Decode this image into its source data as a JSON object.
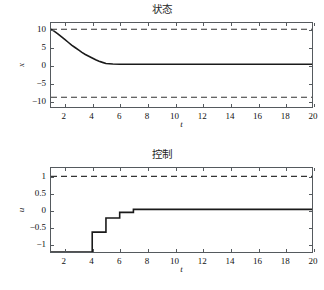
{
  "figure": {
    "background": "#ffffff",
    "line_color": "#1a1a1a",
    "axis_color": "#555a5e",
    "constraint_color": "#333333"
  },
  "chart_data": [
    {
      "type": "line",
      "id": "state-plot",
      "title": "状态",
      "xlabel": "t",
      "ylabel": "x",
      "xlim": [
        1,
        20
      ],
      "ylim": [
        -12,
        12
      ],
      "xticks": [
        2,
        4,
        6,
        8,
        10,
        12,
        14,
        16,
        18,
        20
      ],
      "yticks": [
        10,
        5,
        0,
        -5,
        -10
      ],
      "ytick_labels": [
        "10",
        "5",
        "0",
        "−5",
        "−10"
      ],
      "grid": false,
      "legend": "none",
      "series": [
        {
          "name": "x(t)",
          "style": "solid",
          "x": [
            1,
            1.25,
            1.5,
            1.75,
            2,
            2.25,
            2.5,
            2.75,
            3,
            3.25,
            3.5,
            3.75,
            4,
            4.25,
            4.5,
            4.75,
            5,
            5.5,
            6,
            7,
            8,
            9,
            10,
            12,
            14,
            16,
            18,
            20
          ],
          "values": [
            10.2,
            9.6,
            8.9,
            8.1,
            7.3,
            6.5,
            5.7,
            5.0,
            4.3,
            3.6,
            3.0,
            2.5,
            2.0,
            1.5,
            1.1,
            0.75,
            0.45,
            0.3,
            0.22,
            0.2,
            0.2,
            0.2,
            0.2,
            0.2,
            0.2,
            0.2,
            0.2,
            0.2
          ]
        }
      ],
      "constraints": [
        {
          "name": "upper-bound",
          "value": 10.2,
          "style": "dashed"
        },
        {
          "name": "lower-bound",
          "value": -9.2,
          "style": "dashed"
        }
      ]
    },
    {
      "type": "line",
      "id": "control-plot",
      "title": "控制",
      "xlabel": "t",
      "ylabel": "u",
      "xlim": [
        1,
        20
      ],
      "ylim": [
        -1.25,
        1.25
      ],
      "xticks": [
        2,
        4,
        6,
        8,
        10,
        12,
        14,
        16,
        18,
        20
      ],
      "yticks": [
        1,
        0.5,
        0,
        -0.5,
        -1
      ],
      "ytick_labels": [
        "1",
        "0.5",
        "0",
        "−0.5",
        "−1"
      ],
      "grid": false,
      "legend": "none",
      "series": [
        {
          "name": "u(t)",
          "style": "step",
          "x": [
            1,
            4,
            4,
            5,
            5,
            6,
            6,
            7,
            7,
            20
          ],
          "values": [
            -1.25,
            -1.25,
            -0.66,
            -0.66,
            -0.24,
            -0.24,
            -0.07,
            -0.07,
            0.02,
            0.02
          ]
        }
      ],
      "constraints": [
        {
          "name": "upper-bound",
          "value": 1.0,
          "style": "dashed"
        }
      ]
    }
  ]
}
